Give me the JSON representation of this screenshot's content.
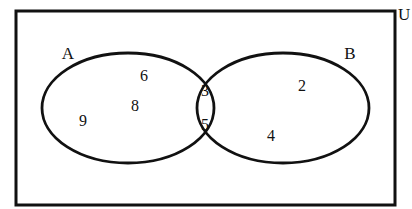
{
  "figure": {
    "kind": "venn-diagram",
    "background_color": "#ffffff",
    "stroke_color": "#111111"
  },
  "universe": {
    "label": "U",
    "label_x": 398,
    "label_y": 14,
    "rect": {
      "x": 16,
      "y": 11,
      "width": 379,
      "height": 194
    }
  },
  "sets": [
    {
      "id": "A",
      "label": "A",
      "label_x": 68,
      "label_y": 55,
      "ellipse": {
        "cx": 128,
        "cy": 108,
        "rx": 86,
        "ry": 55
      }
    },
    {
      "id": "B",
      "label": "B",
      "label_x": 350,
      "label_y": 55,
      "ellipse": {
        "cx": 283,
        "cy": 108,
        "rx": 86,
        "ry": 55
      }
    }
  ],
  "elements": [
    {
      "value": "6",
      "region": "A-only",
      "x": 144,
      "y": 77
    },
    {
      "value": "8",
      "region": "A-only",
      "x": 135,
      "y": 107
    },
    {
      "value": "9",
      "region": "A-only",
      "x": 83,
      "y": 122
    },
    {
      "value": "3",
      "region": "A-and-B",
      "x": 205,
      "y": 92
    },
    {
      "value": "5",
      "region": "A-and-B",
      "x": 205,
      "y": 126
    },
    {
      "value": "2",
      "region": "B-only",
      "x": 302,
      "y": 87
    },
    {
      "value": "4",
      "region": "B-only",
      "x": 271,
      "y": 137
    }
  ],
  "chart_data": {
    "type": "venn",
    "title": "",
    "universe_label": "U",
    "set_labels": [
      "A",
      "B"
    ],
    "regions": {
      "A_only": [
        "6",
        "8",
        "9"
      ],
      "intersection": [
        "3",
        "5"
      ],
      "B_only": [
        "2",
        "4"
      ],
      "outside": []
    },
    "counts": {
      "A_only": 3,
      "intersection": 2,
      "B_only": 2,
      "outside": 0,
      "A_total": 5,
      "B_total": 4,
      "universe_total": 7
    }
  }
}
